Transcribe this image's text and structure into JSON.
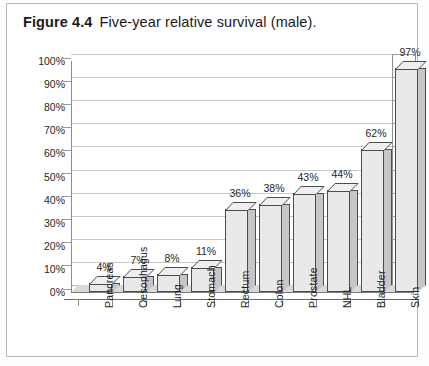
{
  "figure": {
    "number": "Figure 4.4",
    "caption": "Five-year relative survival (male)."
  },
  "chart_data": {
    "type": "bar",
    "title": "Five-year relative survival (male).",
    "xlabel": "",
    "ylabel": "",
    "ylim": [
      0,
      100
    ],
    "yticks": [
      "0%",
      "10%",
      "20%",
      "30%",
      "40%",
      "50%",
      "60%",
      "70%",
      "80%",
      "90%",
      "100%"
    ],
    "ytick_values": [
      0,
      10,
      20,
      30,
      40,
      50,
      60,
      70,
      80,
      90,
      100
    ],
    "grid": true,
    "legend": "none",
    "style": "3d-column",
    "categories": [
      "Pancreas",
      "Oesophagus",
      "Lung",
      "Stomach",
      "Rectum",
      "Colon",
      "Prostate",
      "NHL",
      "Bladder",
      "Skin"
    ],
    "values": [
      4,
      7,
      8,
      11,
      36,
      38,
      43,
      44,
      62,
      97
    ],
    "data_labels": [
      "4%",
      "7%",
      "8%",
      "11%",
      "36%",
      "38%",
      "43%",
      "44%",
      "62%",
      "97%"
    ],
    "colors": {
      "bar_front": "#e9e9e9",
      "bar_side": "#c6c6c6",
      "bar_top": "#efefef",
      "bar_outline": "#4d4d4d",
      "gridline": "#c8c8c8",
      "axis": "#7a7a7a",
      "floor": "#d9d9d9",
      "text": "#1f1f1f",
      "frame": "#b9b9b9"
    }
  }
}
